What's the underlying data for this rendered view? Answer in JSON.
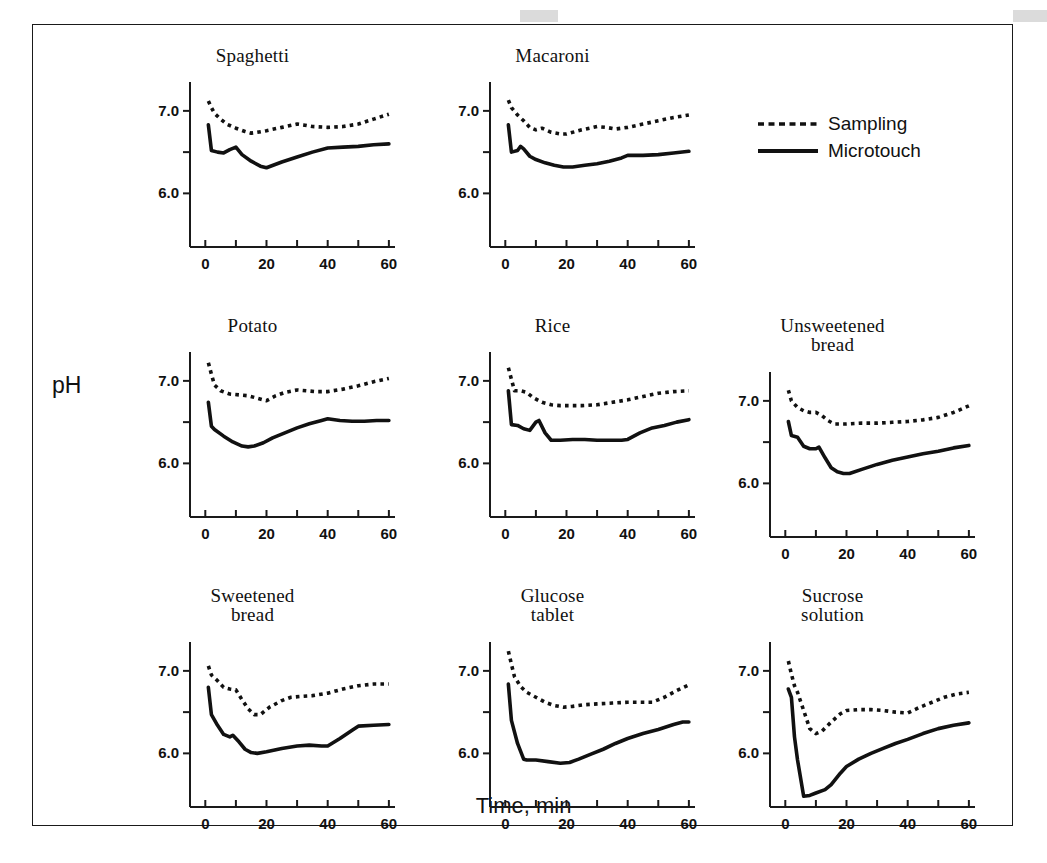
{
  "figure": {
    "y_axis_label": "pH",
    "x_axis_label": "Time, min"
  },
  "legend": {
    "position": "top-right",
    "items": [
      {
        "label": "Sampling",
        "style": "dotted"
      },
      {
        "label": "Microtouch",
        "style": "solid"
      }
    ]
  },
  "chart_data": {
    "type": "line",
    "title": "",
    "xlabel": "Time, min",
    "ylabel": "pH",
    "xlim": [
      -5,
      62
    ],
    "ylim": [
      5.35,
      7.35
    ],
    "xticks": [
      0,
      10,
      20,
      30,
      40,
      50,
      60
    ],
    "xticklabels": [
      "0",
      "",
      "20",
      "",
      "40",
      "",
      "60"
    ],
    "yticks": [
      6.0,
      6.5,
      7.0
    ],
    "yticklabels": [
      "6.0",
      "",
      "7.0"
    ],
    "grid": false,
    "legend_position": "top-right",
    "series_names": [
      "Sampling",
      "Microtouch"
    ],
    "panels": [
      {
        "title": "Spaghetti",
        "title_lines": [
          "Spaghetti"
        ],
        "series": [
          {
            "name": "Sampling",
            "style": "dotted",
            "x": [
              1,
              2,
              3,
              5,
              7,
              10,
              13,
              15,
              17,
              20,
              25,
              30,
              32,
              35,
              40,
              45,
              50,
              55,
              60
            ],
            "y": [
              7.12,
              7.04,
              6.97,
              6.9,
              6.84,
              6.79,
              6.75,
              6.73,
              6.74,
              6.76,
              6.8,
              6.84,
              6.83,
              6.81,
              6.8,
              6.81,
              6.84,
              6.9,
              6.96
            ]
          },
          {
            "name": "Microtouch",
            "style": "solid",
            "x": [
              1,
              2,
              4,
              6,
              8,
              10,
              12,
              15,
              18,
              20,
              25,
              30,
              35,
              40,
              45,
              50,
              55,
              60
            ],
            "y": [
              6.83,
              6.52,
              6.5,
              6.49,
              6.53,
              6.56,
              6.47,
              6.39,
              6.33,
              6.31,
              6.38,
              6.44,
              6.5,
              6.55,
              6.56,
              6.57,
              6.59,
              6.6
            ]
          }
        ]
      },
      {
        "title": "Macaroni",
        "title_lines": [
          "Macaroni"
        ],
        "series": [
          {
            "name": "Sampling",
            "style": "dotted",
            "x": [
              1,
              2,
              4,
              6,
              8,
              10,
              12,
              15,
              18,
              20,
              25,
              30,
              33,
              36,
              40,
              45,
              50,
              55,
              60
            ],
            "y": [
              7.13,
              7.04,
              6.95,
              6.88,
              6.8,
              6.77,
              6.79,
              6.74,
              6.72,
              6.72,
              6.77,
              6.81,
              6.8,
              6.78,
              6.8,
              6.84,
              6.88,
              6.92,
              6.95
            ]
          },
          {
            "name": "Microtouch",
            "style": "solid",
            "x": [
              1,
              2,
              4,
              5,
              6,
              8,
              10,
              13,
              16,
              19,
              22,
              26,
              30,
              34,
              38,
              40,
              45,
              50,
              55,
              60
            ],
            "y": [
              6.83,
              6.5,
              6.52,
              6.57,
              6.54,
              6.45,
              6.41,
              6.37,
              6.34,
              6.32,
              6.32,
              6.34,
              6.36,
              6.39,
              6.43,
              6.46,
              6.46,
              6.47,
              6.49,
              6.51
            ]
          }
        ]
      },
      {
        "title": "Potato",
        "title_lines": [
          "Potato"
        ],
        "series": [
          {
            "name": "Sampling",
            "style": "dotted",
            "x": [
              1,
              2,
              3,
              5,
              8,
              11,
              14,
              17,
              20,
              23,
              26,
              30,
              33,
              36,
              40,
              45,
              50,
              55,
              60
            ],
            "y": [
              7.22,
              7.08,
              6.95,
              6.88,
              6.84,
              6.83,
              6.82,
              6.79,
              6.76,
              6.82,
              6.86,
              6.89,
              6.88,
              6.87,
              6.87,
              6.9,
              6.94,
              6.99,
              7.03
            ]
          },
          {
            "name": "Microtouch",
            "style": "solid",
            "x": [
              1,
              2,
              3,
              6,
              9,
              12,
              14,
              16,
              19,
              22,
              26,
              30,
              34,
              38,
              40,
              44,
              48,
              52,
              56,
              60
            ],
            "y": [
              6.74,
              6.45,
              6.41,
              6.33,
              6.26,
              6.21,
              6.2,
              6.21,
              6.25,
              6.31,
              6.37,
              6.43,
              6.48,
              6.52,
              6.54,
              6.52,
              6.51,
              6.51,
              6.52,
              6.52
            ]
          }
        ]
      },
      {
        "title": "Rice",
        "title_lines": [
          "Rice"
        ],
        "series": [
          {
            "name": "Sampling",
            "style": "dotted",
            "x": [
              1,
              2,
              3,
              5,
              7,
              9,
              12,
              15,
              18,
              21,
              25,
              30,
              35,
              40,
              45,
              50,
              55,
              60
            ],
            "y": [
              7.16,
              7.02,
              6.88,
              6.88,
              6.86,
              6.8,
              6.74,
              6.71,
              6.7,
              6.7,
              6.7,
              6.71,
              6.74,
              6.77,
              6.81,
              6.85,
              6.87,
              6.88
            ]
          },
          {
            "name": "Microtouch",
            "style": "solid",
            "x": [
              1,
              2,
              4,
              6,
              8,
              10,
              11,
              13,
              15,
              18,
              22,
              26,
              30,
              34,
              38,
              40,
              44,
              48,
              52,
              56,
              60
            ],
            "y": [
              6.88,
              6.47,
              6.46,
              6.42,
              6.4,
              6.5,
              6.52,
              6.37,
              6.28,
              6.28,
              6.29,
              6.29,
              6.28,
              6.28,
              6.28,
              6.29,
              6.37,
              6.43,
              6.46,
              6.5,
              6.53
            ]
          }
        ]
      },
      {
        "title": "Unsweetened bread",
        "title_lines": [
          "Unsweetened",
          "bread"
        ],
        "series": [
          {
            "name": "Sampling",
            "style": "dotted",
            "x": [
              1,
              2,
              4,
              6,
              8,
              10,
              12,
              14,
              16,
              20,
              25,
              30,
              35,
              40,
              45,
              50,
              55,
              60
            ],
            "y": [
              7.13,
              7.0,
              6.92,
              6.88,
              6.86,
              6.86,
              6.82,
              6.76,
              6.72,
              6.72,
              6.73,
              6.73,
              6.74,
              6.75,
              6.77,
              6.8,
              6.86,
              6.94
            ]
          },
          {
            "name": "Microtouch",
            "style": "solid",
            "x": [
              1,
              2,
              4,
              6,
              8,
              10,
              11,
              13,
              15,
              17,
              19,
              21,
              25,
              30,
              35,
              40,
              45,
              50,
              55,
              60
            ],
            "y": [
              6.75,
              6.58,
              6.56,
              6.45,
              6.42,
              6.42,
              6.44,
              6.31,
              6.19,
              6.14,
              6.12,
              6.12,
              6.17,
              6.23,
              6.28,
              6.32,
              6.36,
              6.39,
              6.43,
              6.46
            ]
          }
        ]
      },
      {
        "title": "Sweetened bread",
        "title_lines": [
          "Sweetened",
          "bread"
        ],
        "series": [
          {
            "name": "Sampling",
            "style": "dotted",
            "x": [
              1,
              2,
              4,
              6,
              8,
              10,
              12,
              14,
              16,
              18,
              21,
              25,
              28,
              31,
              35,
              40,
              45,
              50,
              55,
              60
            ],
            "y": [
              7.06,
              6.95,
              6.88,
              6.8,
              6.78,
              6.77,
              6.65,
              6.54,
              6.47,
              6.47,
              6.56,
              6.64,
              6.68,
              6.69,
              6.7,
              6.73,
              6.78,
              6.82,
              6.84,
              6.84
            ]
          },
          {
            "name": "Microtouch",
            "style": "solid",
            "x": [
              1,
              2,
              4,
              6,
              8,
              9,
              11,
              13,
              15,
              17,
              20,
              25,
              30,
              34,
              38,
              40,
              44,
              48,
              50,
              55,
              60
            ],
            "y": [
              6.8,
              6.47,
              6.34,
              6.23,
              6.2,
              6.22,
              6.14,
              6.05,
              6.01,
              6.0,
              6.02,
              6.06,
              6.09,
              6.1,
              6.09,
              6.09,
              6.18,
              6.28,
              6.33,
              6.34,
              6.35
            ]
          }
        ]
      },
      {
        "title": "Glucose tablet",
        "title_lines": [
          "Glucose",
          "tablet"
        ],
        "series": [
          {
            "name": "Sampling",
            "style": "dotted",
            "x": [
              1,
              2,
              3,
              5,
              7,
              10,
              13,
              16,
              19,
              22,
              26,
              30,
              35,
              40,
              45,
              48,
              52,
              56,
              60
            ],
            "y": [
              7.24,
              7.08,
              6.93,
              6.81,
              6.74,
              6.68,
              6.62,
              6.58,
              6.56,
              6.57,
              6.59,
              6.6,
              6.61,
              6.62,
              6.62,
              6.62,
              6.68,
              6.76,
              6.83
            ]
          },
          {
            "name": "Microtouch",
            "style": "solid",
            "x": [
              1,
              2,
              4,
              6,
              7,
              10,
              14,
              18,
              21,
              24,
              28,
              32,
              36,
              40,
              45,
              50,
              55,
              58,
              60
            ],
            "y": [
              6.84,
              6.4,
              6.12,
              5.93,
              5.92,
              5.92,
              5.9,
              5.88,
              5.89,
              5.93,
              5.99,
              6.05,
              6.12,
              6.18,
              6.24,
              6.29,
              6.35,
              6.38,
              6.38
            ]
          }
        ]
      },
      {
        "title": "Sucrose solution",
        "title_lines": [
          "Sucrose",
          "solution"
        ],
        "series": [
          {
            "name": "Sampling",
            "style": "dotted",
            "x": [
              1,
              2,
              3,
              4,
              6,
              8,
              10,
              12,
              15,
              18,
              20,
              24,
              28,
              32,
              36,
              40,
              44,
              48,
              52,
              56,
              60
            ],
            "y": [
              7.12,
              6.96,
              6.82,
              6.74,
              6.52,
              6.3,
              6.24,
              6.27,
              6.38,
              6.48,
              6.52,
              6.53,
              6.53,
              6.52,
              6.5,
              6.49,
              6.56,
              6.62,
              6.68,
              6.72,
              6.74
            ]
          },
          {
            "name": "Microtouch",
            "style": "solid",
            "x": [
              1,
              2,
              3,
              4,
              6,
              8,
              10,
              13,
              15,
              18,
              20,
              24,
              28,
              32,
              36,
              40,
              45,
              50,
              55,
              60
            ],
            "y": [
              6.78,
              6.68,
              6.2,
              5.92,
              5.48,
              5.49,
              5.52,
              5.56,
              5.62,
              5.76,
              5.84,
              5.93,
              6.0,
              6.06,
              6.12,
              6.17,
              6.24,
              6.3,
              6.34,
              6.37
            ]
          }
        ]
      }
    ]
  }
}
